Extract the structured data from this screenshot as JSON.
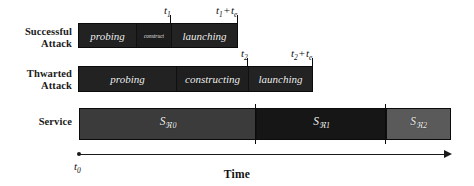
{
  "figure": {
    "axis_title": "Time",
    "origin_label": "t",
    "origin_sub": "0"
  },
  "rows": [
    {
      "label": "Successful\nAttack",
      "segments": [
        {
          "name": "probing",
          "label": "probing"
        },
        {
          "name": "construct",
          "label": "construct"
        },
        {
          "name": "launching",
          "label": "launching"
        }
      ]
    },
    {
      "label": "Thwarted\nAttack",
      "segments": [
        {
          "name": "probing",
          "label": "probing"
        },
        {
          "name": "constructing",
          "label": "constructing"
        },
        {
          "name": "launching",
          "label": "launching"
        }
      ]
    },
    {
      "label": "Service",
      "segments": [
        {
          "name": "service-0",
          "base": "S",
          "sub": "ℜ0"
        },
        {
          "name": "service-1",
          "base": "S",
          "sub": "ℜ1"
        },
        {
          "name": "service-2",
          "base": "S",
          "sub": "ℜ2"
        }
      ]
    }
  ],
  "time_marks": {
    "t1": {
      "base": "t",
      "sub": "1"
    },
    "t1_plus": {
      "base": "t",
      "sub": "1",
      "op": "+",
      "base2": "t",
      "sub2": "e"
    },
    "t2": {
      "base": "t",
      "sub": "2"
    },
    "t2_plus": {
      "base": "t",
      "sub": "2",
      "op": "+",
      "base2": "t",
      "sub2": "e"
    }
  },
  "colors": {
    "attack_bar": "#222222",
    "service_0": "#3b3b3b",
    "service_1": "#161616",
    "service_2": "#5a5a5a",
    "text": "#111111",
    "bar_text": "#f2f2f2"
  }
}
